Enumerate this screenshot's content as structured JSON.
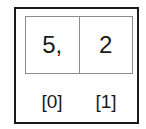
{
  "array": {
    "cells": [
      {
        "value": "5,",
        "index_label": "[0]"
      },
      {
        "value": "2",
        "index_label": "[1]"
      }
    ]
  },
  "colors": {
    "frame_border": "#1a1a1a",
    "cell_border": "#8c8c8c",
    "text": "#1a1a1a",
    "background": "#ffffff"
  }
}
